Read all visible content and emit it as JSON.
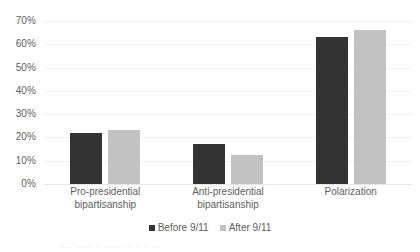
{
  "chart_data": {
    "type": "bar",
    "title": "",
    "subtitle": "",
    "xlabel": "",
    "ylabel": "",
    "ylim": [
      0,
      70
    ],
    "ytick_step": 10,
    "ytick_labels": [
      "70%",
      "60%",
      "50%",
      "40%",
      "30%",
      "20%",
      "10%",
      "0%"
    ],
    "ytick_values": [
      70,
      60,
      50,
      40,
      30,
      20,
      10,
      0
    ],
    "grid": true,
    "legend_position": "bottom",
    "categories": [
      "Pro-presidential bipartisanship",
      "Anti-presidential bipartisanship",
      "Polarization"
    ],
    "category_lines": [
      [
        "Pro-presidential",
        "bipartisanship"
      ],
      [
        "Anti-presidential",
        "bipartisanship"
      ],
      [
        "Polarization",
        ""
      ]
    ],
    "series": [
      {
        "name": "Before 9/11",
        "color": "#333333",
        "values": [
          22,
          17,
          63
        ]
      },
      {
        "name": "After 9/11",
        "color": "#c2c2c2",
        "values": [
          23,
          12.5,
          66
        ]
      }
    ]
  },
  "legend": {
    "items": [
      {
        "label": "Before 9/11",
        "swatch": "before"
      },
      {
        "label": "After 9/11",
        "swatch": "after"
      }
    ]
  },
  "caption": {
    "cutoff_text": "....   ..  ...  ..   ..  .  .. ..      .. ..     .."
  }
}
